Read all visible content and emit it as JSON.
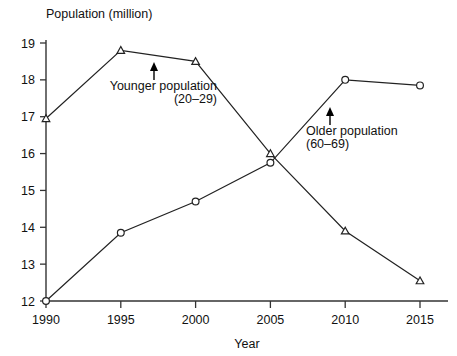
{
  "chart_data": {
    "type": "line",
    "title": "Population (million)",
    "xlabel": "Year",
    "ylabel": "Population (million)",
    "x": [
      1990,
      1995,
      2000,
      2005,
      2010,
      2015
    ],
    "xticklabels": [
      "1990",
      "1995",
      "2000",
      "2005",
      "2010",
      "2015"
    ],
    "yticklabels": [
      "12",
      "13",
      "14",
      "15",
      "16",
      "17",
      "18",
      "19"
    ],
    "yticks": [
      12,
      13,
      14,
      15,
      16,
      17,
      18,
      19
    ],
    "xlim": [
      1990,
      2015
    ],
    "ylim": [
      12,
      19
    ],
    "grid": false,
    "legend": "none",
    "series": [
      {
        "name": "Younger population (20–29)",
        "marker": "triangle",
        "values": [
          16.95,
          18.8,
          18.5,
          16.0,
          13.9,
          12.55
        ]
      },
      {
        "name": "Older population (60–69)",
        "marker": "circle",
        "values": [
          12.0,
          13.85,
          14.7,
          15.75,
          18.0,
          17.85
        ]
      }
    ],
    "annotations": [
      {
        "id": "younger",
        "line1": "Younger population",
        "line2": "(20–29)",
        "align": "right",
        "points_to": {
          "x": 1997,
          "y": 18.62
        }
      },
      {
        "id": "older",
        "line1": "Older population",
        "line2": "(60–69)",
        "align": "left",
        "points_to": {
          "x": 2008.6,
          "y": 17.3
        }
      }
    ],
    "colors": {
      "line": "#222222",
      "axis": "#333333",
      "text": "#111111",
      "background": "#ffffff",
      "marker_fill": "#ffffff"
    }
  }
}
